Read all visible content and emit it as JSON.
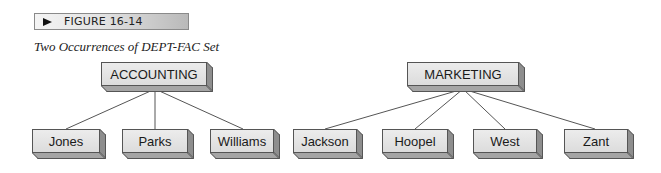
{
  "figure": {
    "banner_label": "FIGURE 16-14",
    "caption": "Two Occurrences of DEPT-FAC Set"
  },
  "diagram": {
    "occurrences": [
      {
        "owner": "ACCOUNTING",
        "members": [
          "Jones",
          "Parks",
          "Williams"
        ]
      },
      {
        "owner": "MARKETING",
        "members": [
          "Jackson",
          "Hoopel",
          "West",
          "Zant"
        ]
      }
    ]
  }
}
